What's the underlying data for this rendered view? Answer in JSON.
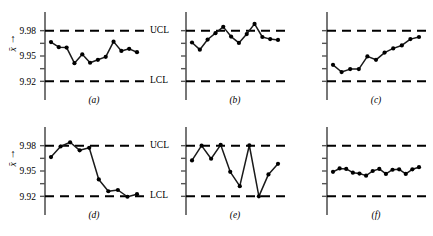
{
  "figure": {
    "axis_label_symbol": "x̄",
    "axis_label_arrow": "↑",
    "y_ticks": [
      "9.98",
      "9.95",
      "9.92"
    ],
    "limit_labels": {
      "upper": "UCL",
      "lower": "LCL"
    },
    "colors": {
      "line": "#1a1a1a",
      "marker": "#000000",
      "axis": "#555555",
      "limit": "#000000"
    }
  },
  "captions": {
    "a": "(a)",
    "b": "(b)",
    "c": "(c)",
    "d": "(d)",
    "e": "(e)",
    "f": "(f)"
  },
  "chart_data": [
    {
      "type": "line",
      "panel": "a",
      "title": "(a)",
      "xlabel": "",
      "ylabel": "x̄",
      "ylim": [
        9.905,
        9.995
      ],
      "yticks": [
        9.98,
        9.95,
        9.92
      ],
      "grid": false,
      "legend": "none",
      "control_limits": {
        "UCL": 9.98,
        "LCL": 9.92
      },
      "x": [
        1,
        2,
        3,
        4,
        5,
        6,
        7,
        8,
        9,
        10,
        11,
        12
      ],
      "values": [
        9.9665,
        9.9605,
        9.96,
        9.9415,
        9.952,
        9.942,
        9.9455,
        9.949,
        9.967,
        9.956,
        9.9585,
        9.9545
      ]
    },
    {
      "type": "line",
      "panel": "b",
      "title": "(b)",
      "xlabel": "",
      "ylabel": "x̄",
      "ylim": [
        9.905,
        9.995
      ],
      "yticks": [
        9.98,
        9.95,
        9.92
      ],
      "grid": false,
      "legend": "none",
      "control_limits": {
        "UCL": 9.98,
        "LCL": 9.92
      },
      "x": [
        1,
        2,
        3,
        4,
        5,
        6,
        7,
        8,
        9,
        10,
        11,
        12
      ],
      "values": [
        9.966,
        9.9575,
        9.9695,
        9.977,
        9.9845,
        9.973,
        9.9655,
        9.976,
        9.988,
        9.9725,
        9.97,
        9.969
      ]
    },
    {
      "type": "line",
      "panel": "c",
      "title": "(c)",
      "xlabel": "",
      "ylabel": "x̄",
      "ylim": [
        9.905,
        9.995
      ],
      "yticks": [
        9.98,
        9.95,
        9.92
      ],
      "grid": false,
      "legend": "none",
      "control_limits": {
        "UCL": 9.98,
        "LCL": 9.92
      },
      "x": [
        1,
        2,
        3,
        4,
        5,
        6,
        7,
        8,
        9,
        10,
        11,
        12
      ],
      "values": [
        9.9395,
        9.931,
        9.9345,
        9.9345,
        9.9495,
        9.9455,
        9.954,
        9.959,
        9.9625,
        9.97,
        9.9725
      ]
    },
    {
      "type": "line",
      "panel": "d",
      "title": "(d)",
      "xlabel": "",
      "ylabel": "x̄",
      "ylim": [
        9.905,
        9.995
      ],
      "yticks": [
        9.98,
        9.95,
        9.92
      ],
      "grid": false,
      "legend": "none",
      "control_limits": {
        "UCL": 9.98,
        "LCL": 9.92
      },
      "x": [
        1,
        2,
        3,
        4,
        5,
        6,
        7,
        8,
        9,
        10,
        11,
        12
      ],
      "values": [
        9.9665,
        9.979,
        9.984,
        9.9745,
        9.9775,
        9.94,
        9.926,
        9.9275,
        9.9195,
        9.9225
      ]
    },
    {
      "type": "line",
      "panel": "e",
      "title": "(e)",
      "xlabel": "",
      "ylabel": "x̄",
      "ylim": [
        9.905,
        9.995
      ],
      "yticks": [
        9.98,
        9.95,
        9.92
      ],
      "grid": false,
      "legend": "none",
      "control_limits": {
        "UCL": 9.98,
        "LCL": 9.92
      },
      "x": [
        1,
        2,
        3,
        4,
        5,
        6,
        7,
        8,
        9,
        10,
        11,
        12
      ],
      "values": [
        9.9625,
        9.98,
        9.9645,
        9.981,
        9.949,
        9.932,
        9.9805,
        9.92,
        9.946,
        9.9585
      ]
    },
    {
      "type": "line",
      "panel": "f",
      "title": "(f)",
      "xlabel": "",
      "ylabel": "x̄",
      "ylim": [
        9.905,
        9.995
      ],
      "yticks": [
        9.98,
        9.95,
        9.92
      ],
      "grid": false,
      "legend": "none",
      "control_limits": {
        "UCL": 9.98,
        "LCL": 9.92
      },
      "x": [
        1,
        2,
        3,
        4,
        5,
        6,
        7,
        8,
        9,
        10,
        11,
        12,
        13,
        14
      ],
      "values": [
        9.949,
        9.953,
        9.9525,
        9.948,
        9.947,
        9.9445,
        9.95,
        9.9525,
        9.9465,
        9.9515,
        9.952,
        9.9465,
        9.952,
        9.9545
      ]
    }
  ]
}
